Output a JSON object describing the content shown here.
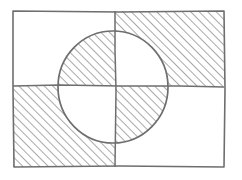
{
  "diagram": {
    "type": "hand-drawn sketch",
    "colors": {
      "background": "#ffffff",
      "stroke": "#6e6e6e",
      "hatch": "#7a7a7a"
    },
    "rectangle": {
      "x1": 13,
      "y1": 11,
      "x2": 224,
      "y2": 167
    },
    "dividers": {
      "vertical_x": 115,
      "horizontal_y": 86
    },
    "circle": {
      "cx": 113,
      "cy": 87,
      "rx": 55,
      "ry": 56
    },
    "regions": [
      {
        "quadrant": "top-left",
        "inside_circle_hatched": true,
        "outside_circle_hatched": false
      },
      {
        "quadrant": "top-right",
        "inside_circle_hatched": false,
        "outside_circle_hatched": true
      },
      {
        "quadrant": "bottom-left",
        "inside_circle_hatched": false,
        "outside_circle_hatched": true
      },
      {
        "quadrant": "bottom-right",
        "inside_circle_hatched": true,
        "outside_circle_hatched": false
      }
    ]
  }
}
